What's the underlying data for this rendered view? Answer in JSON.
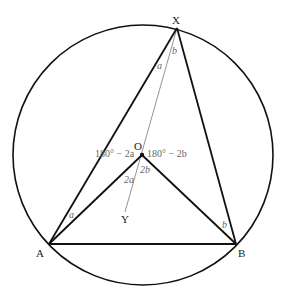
{
  "diagram": {
    "points": {
      "X": {
        "label": "X",
        "x": 177,
        "y": 28
      },
      "A": {
        "label": "A",
        "x": 49,
        "y": 244
      },
      "B": {
        "label": "B",
        "x": 236,
        "y": 244
      },
      "O": {
        "label": "O",
        "x": 142,
        "y": 155
      },
      "Y": {
        "label": "Y",
        "x": 125,
        "y": 212
      }
    },
    "circle": {
      "cx": 143,
      "cy": 155,
      "r": 130
    },
    "angle_labels": {
      "a_at_X": "a",
      "b_at_X": "b",
      "a_at_A": "a",
      "b_at_B": "b",
      "left_at_O": "180° − 2a",
      "right_at_O": "180° − 2b",
      "2a_at_O": "2a",
      "2b_at_O": "2b"
    },
    "colors": {
      "stroke": "#111111",
      "thin": "#888888",
      "label": "#666666"
    }
  }
}
